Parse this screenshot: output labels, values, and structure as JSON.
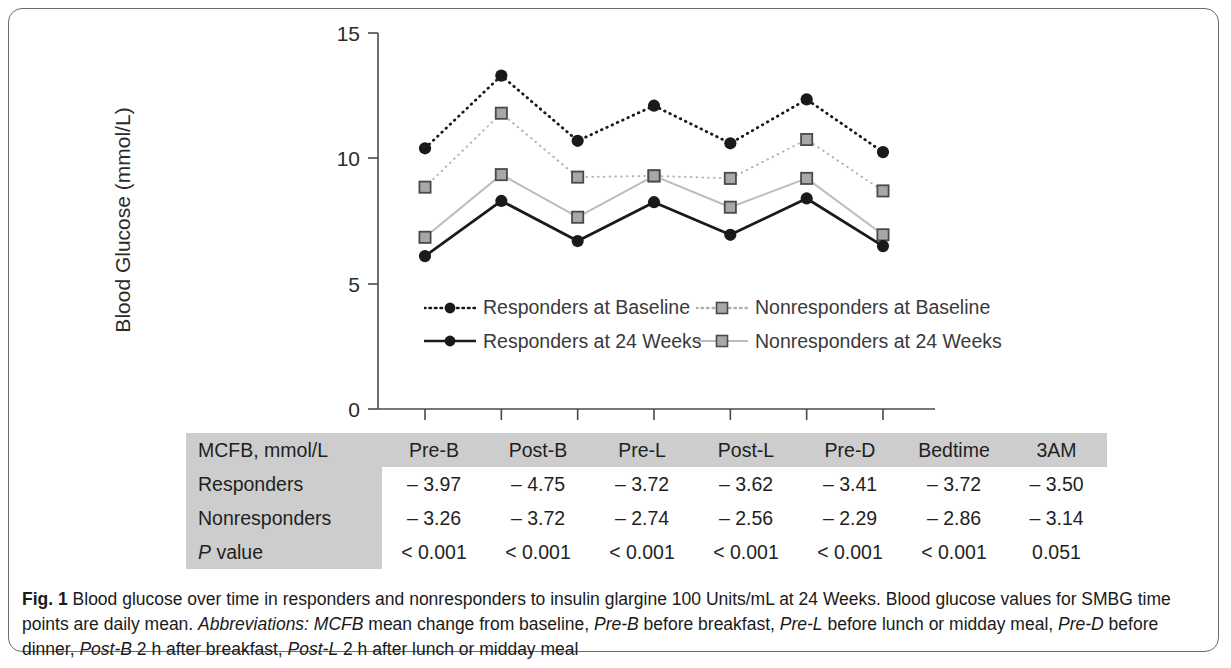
{
  "chart_data": {
    "type": "line",
    "title": "",
    "xlabel": "",
    "ylabel": "Blood Glucose (mmol/L)",
    "ylim": [
      0,
      15
    ],
    "yticks": [
      0,
      5,
      10,
      15
    ],
    "grid": false,
    "legend_position": "inside-bottom",
    "categories": [
      "Pre-B",
      "Post-B",
      "Pre-L",
      "Post-L",
      "Pre-D",
      "Bedtime",
      "3AM"
    ],
    "series": [
      {
        "name": "Responders at Baseline",
        "marker": "filled-circle",
        "line_style": "dotted",
        "color": "#1a1a1a",
        "values": [
          10.4,
          13.3,
          10.7,
          12.1,
          10.6,
          12.35,
          10.25
        ]
      },
      {
        "name": "Nonresponders at Baseline",
        "marker": "gray-square",
        "line_style": "dotted",
        "color": "#9a9a9a",
        "values": [
          8.85,
          11.8,
          9.25,
          9.3,
          9.2,
          10.75,
          8.7
        ]
      },
      {
        "name": "Responders at 24 Weeks",
        "marker": "filled-circle",
        "line_style": "solid",
        "color": "#1a1a1a",
        "values": [
          6.1,
          8.3,
          6.7,
          8.25,
          6.95,
          8.4,
          6.5
        ]
      },
      {
        "name": "Nonresponders at 24 Weeks",
        "marker": "gray-square",
        "line_style": "solid",
        "color": "#9a9a9a",
        "values": [
          6.85,
          9.35,
          7.65,
          9.3,
          8.05,
          9.2,
          6.95
        ]
      }
    ]
  },
  "legend": {
    "entries": [
      {
        "label": "Responders at Baseline"
      },
      {
        "label": "Nonresponders at Baseline"
      },
      {
        "label": "Responders at 24 Weeks"
      },
      {
        "label": "Nonresponders at 24 Weeks"
      }
    ]
  },
  "table": {
    "header": [
      "MCFB, mmol/L",
      "Pre-B",
      "Post-B",
      "Pre-L",
      "Post-L",
      "Pre-D",
      "Bedtime",
      "3AM"
    ],
    "rows": [
      {
        "label": "Responders",
        "values": [
          "– 3.97",
          "– 4.75",
          "– 3.72",
          "– 3.62",
          "– 3.41",
          "– 3.72",
          "– 3.50"
        ]
      },
      {
        "label": "Nonresponders",
        "values": [
          "– 3.26",
          "– 3.72",
          "– 2.74",
          "– 2.56",
          "– 2.29",
          "– 2.86",
          "– 3.14"
        ]
      },
      {
        "label_prefix_italic": "P",
        "label": " value",
        "values": [
          "< 0.001",
          "< 0.001",
          "< 0.001",
          "< 0.001",
          "< 0.001",
          "< 0.001",
          "0.051"
        ]
      }
    ]
  },
  "caption": {
    "figure_number": "Fig. 1",
    "segment_1": " Blood glucose over time in responders and nonresponders to insulin glargine 100 Units/mL at 24 Weeks. Blood glucose values for SMBG time points are daily mean. ",
    "abbrev_label": "Abbreviations:",
    "segment_2": " ",
    "term_1": "MCFB",
    "def_1": " mean change from baseline, ",
    "term_2": "Pre-B",
    "def_2": " before breakfast, ",
    "term_3": "Pre-L",
    "def_3": " before lunch or midday meal, ",
    "term_4": "Pre-D",
    "def_4": " before dinner, ",
    "term_5": "Post-B",
    "def_5": " 2 h after breakfast, ",
    "term_6": "Post-L",
    "def_6": " 2 h after lunch or midday meal"
  },
  "axis": {
    "y_title": "Blood Glucose (mmol/L)",
    "tick_0": "0",
    "tick_5": "5",
    "tick_10": "10",
    "tick_15": "15"
  }
}
